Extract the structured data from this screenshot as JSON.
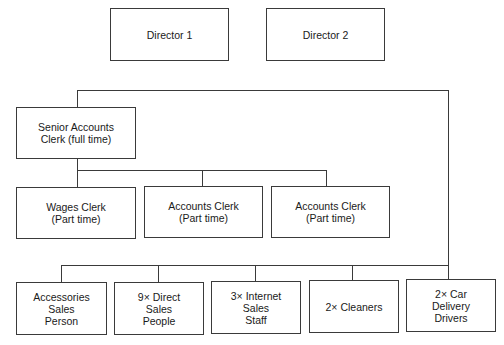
{
  "diagram": {
    "type": "organisation chart",
    "directors": [
      {
        "label": "Director 1"
      },
      {
        "label": "Director 2"
      }
    ],
    "senior": {
      "label": "Senior Accounts\nClerk (full time)"
    },
    "accounts_team": [
      {
        "label": "Wages Clerk\n(Part time)"
      },
      {
        "label": "Accounts Clerk\n(Part time)"
      },
      {
        "label": "Accounts Clerk\n(Part time)"
      }
    ],
    "operations_team": [
      {
        "label": "Accessories\nSales\nPerson"
      },
      {
        "label": "9× Direct\nSales\nPeople"
      },
      {
        "label": "3× Internet\nSales\nStaff"
      },
      {
        "label": "2× Cleaners"
      },
      {
        "label": "2× Car\nDelivery\nDrivers"
      }
    ],
    "colors": {
      "line": "#3a3a3a",
      "background": "#ffffff",
      "text": "#1a1a1a"
    }
  }
}
